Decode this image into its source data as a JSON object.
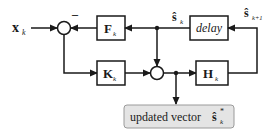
{
  "diagram": {
    "input": {
      "symbol": "x",
      "subscript": "k"
    },
    "minus_sign": "–",
    "blocks": {
      "F": {
        "symbol": "F",
        "subscript": "k"
      },
      "K": {
        "symbol": "K",
        "subscript": "k"
      },
      "H": {
        "symbol": "H",
        "subscript": "k"
      },
      "delay": {
        "label": "delay"
      }
    },
    "signals": {
      "s_hat_k": {
        "symbol": "ŝ",
        "subscript": "k"
      },
      "s_hat_k1": {
        "symbol": "ŝ",
        "subscript": "k+1"
      }
    },
    "output": {
      "label": "updated vector",
      "symbol": "ŝ",
      "subscript": "k",
      "superscript": "*"
    },
    "colors": {
      "line": "#1a1a1a",
      "output_fill": "#e4e4e4",
      "output_stroke": "#9a9a9a"
    }
  }
}
